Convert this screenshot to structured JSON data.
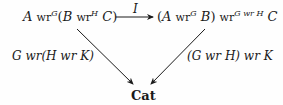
{
  "diagram": {
    "type": "commutative-triangle",
    "nodes": {
      "top_left": {
        "text": "A wr^G(B wr^H C)",
        "parts": {
          "a": "A",
          "wr1": "wr",
          "g": "G",
          "open": "(",
          "b": "B",
          "wr2": "wr",
          "h": "H",
          "c": "C",
          "close": ")"
        }
      },
      "top_right": {
        "text": "(A wr^G B) wr^(G wr H) C",
        "parts": {
          "open": "(",
          "a": "A",
          "wr1": "wr",
          "g": "G",
          "b": "B",
          "close": ")",
          "wr2": "wr",
          "sup": "G wr H",
          "c": "C"
        }
      },
      "bottom": {
        "text": "Cat"
      }
    },
    "arrows": {
      "top": {
        "label": "I",
        "from": "top_left",
        "to": "top_right"
      },
      "left": {
        "label": "G wr(H wr K)",
        "from": "top_left",
        "to": "bottom"
      },
      "right": {
        "label": "(G wr H) wr K",
        "from": "top_right",
        "to": "bottom"
      }
    }
  }
}
